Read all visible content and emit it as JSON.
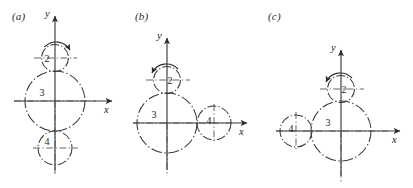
{
  "figure": {
    "width": 413,
    "height": 188,
    "background": "#ffffff",
    "line_color": "#3b3b3b",
    "text_color": "#1c1c1c"
  },
  "panels": [
    {
      "id": "a",
      "label": "(a)",
      "axes": {
        "x_label": "x",
        "y_label": "y"
      },
      "gears": [
        {
          "name": "2",
          "label": "2",
          "position": "above-center"
        },
        {
          "name": "3",
          "label": "3",
          "position": "origin"
        },
        {
          "name": "4",
          "label": "4",
          "position": "below-center"
        }
      ],
      "rotation_arrow": {
        "gear": "2",
        "direction": "clockwise"
      }
    },
    {
      "id": "b",
      "label": "(b)",
      "axes": {
        "x_label": "x",
        "y_label": "y"
      },
      "gears": [
        {
          "name": "2",
          "label": "2",
          "position": "above-center"
        },
        {
          "name": "3",
          "label": "3",
          "position": "origin"
        },
        {
          "name": "4",
          "label": "4",
          "position": "right-of-center"
        }
      ],
      "rotation_arrow": {
        "gear": "2",
        "direction": "counterclockwise"
      }
    },
    {
      "id": "c",
      "label": "(c)",
      "axes": {
        "x_label": "x",
        "y_label": "y"
      },
      "gears": [
        {
          "name": "2",
          "label": "2",
          "position": "above-center"
        },
        {
          "name": "3",
          "label": "3",
          "position": "origin"
        },
        {
          "name": "4",
          "label": "4",
          "position": "left-of-center"
        }
      ],
      "rotation_arrow": {
        "gear": "2",
        "direction": "counterclockwise"
      }
    }
  ]
}
